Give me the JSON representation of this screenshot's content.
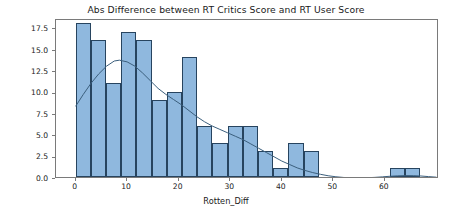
{
  "chart_data": {
    "type": "bar",
    "title": "Abs Difference between RT Critics Score and RT User Score",
    "xlabel": "Rotten_Diff",
    "ylabel": "",
    "grid": false,
    "legend": null,
    "xlim": [
      -3.8,
      70.5
    ],
    "ylim": [
      0,
      18.6
    ],
    "xticks": [
      0,
      10,
      20,
      30,
      40,
      50,
      60
    ],
    "xtick_labels": [
      "0",
      "10",
      "20",
      "30",
      "40",
      "50",
      "60"
    ],
    "yticks": [
      0.0,
      2.5,
      5.0,
      7.5,
      10.0,
      12.5,
      15.0,
      17.5
    ],
    "ytick_labels": [
      "0.0",
      "2.5",
      "5.0",
      "7.5",
      "10.0",
      "12.5",
      "15.0",
      "17.5"
    ],
    "bin_width": 2.95,
    "bins": [
      {
        "x0": 0.0,
        "x1": 2.95,
        "value": 18
      },
      {
        "x0": 2.95,
        "x1": 5.9,
        "value": 16
      },
      {
        "x0": 5.9,
        "x1": 8.85,
        "value": 11
      },
      {
        "x0": 8.85,
        "x1": 11.8,
        "value": 17
      },
      {
        "x0": 11.8,
        "x1": 14.75,
        "value": 16
      },
      {
        "x0": 14.75,
        "x1": 17.7,
        "value": 9
      },
      {
        "x0": 17.7,
        "x1": 20.65,
        "value": 10
      },
      {
        "x0": 20.65,
        "x1": 23.6,
        "value": 14
      },
      {
        "x0": 23.6,
        "x1": 26.55,
        "value": 6
      },
      {
        "x0": 26.55,
        "x1": 29.5,
        "value": 4
      },
      {
        "x0": 29.5,
        "x1": 32.45,
        "value": 6
      },
      {
        "x0": 32.45,
        "x1": 35.4,
        "value": 6
      },
      {
        "x0": 35.4,
        "x1": 38.35,
        "value": 3
      },
      {
        "x0": 38.35,
        "x1": 41.3,
        "value": 1
      },
      {
        "x0": 41.3,
        "x1": 44.25,
        "value": 4
      },
      {
        "x0": 44.25,
        "x1": 47.2,
        "value": 3
      },
      {
        "x0": 61.0,
        "x1": 63.95,
        "value": 1
      },
      {
        "x0": 63.95,
        "x1": 66.9,
        "value": 1
      }
    ],
    "kde": {
      "label": "kde-density-curve",
      "color": "#3b5f7d",
      "points": [
        [
          0.0,
          8.5
        ],
        [
          1.5,
          9.9
        ],
        [
          3.0,
          11.2
        ],
        [
          4.5,
          12.3
        ],
        [
          6.0,
          13.2
        ],
        [
          7.5,
          13.8
        ],
        [
          8.5,
          13.9
        ],
        [
          10.0,
          13.7
        ],
        [
          11.5,
          13.2
        ],
        [
          13.0,
          12.4
        ],
        [
          14.5,
          11.5
        ],
        [
          16.0,
          10.6
        ],
        [
          17.5,
          9.9
        ],
        [
          19.0,
          9.3
        ],
        [
          20.5,
          8.7
        ],
        [
          22.0,
          8.0
        ],
        [
          23.5,
          7.3
        ],
        [
          25.0,
          6.7
        ],
        [
          26.5,
          6.2
        ],
        [
          28.0,
          5.8
        ],
        [
          29.5,
          5.4
        ],
        [
          31.0,
          5.0
        ],
        [
          32.5,
          4.6
        ],
        [
          34.0,
          4.1
        ],
        [
          35.5,
          3.6
        ],
        [
          37.0,
          3.1
        ],
        [
          38.5,
          2.6
        ],
        [
          40.0,
          2.1
        ],
        [
          41.5,
          1.7
        ],
        [
          43.0,
          1.3
        ],
        [
          44.5,
          1.0
        ],
        [
          46.0,
          0.75
        ],
        [
          47.5,
          0.55
        ],
        [
          49.0,
          0.38
        ],
        [
          50.5,
          0.26
        ],
        [
          52.0,
          0.18
        ],
        [
          53.5,
          0.14
        ],
        [
          55.0,
          0.13
        ],
        [
          56.5,
          0.15
        ],
        [
          58.0,
          0.19
        ],
        [
          59.5,
          0.25
        ],
        [
          61.0,
          0.32
        ],
        [
          62.5,
          0.37
        ],
        [
          64.0,
          0.4
        ],
        [
          65.5,
          0.39
        ],
        [
          67.0,
          0.35
        ],
        [
          68.5,
          0.28
        ],
        [
          70.0,
          0.21
        ]
      ]
    },
    "colors": {
      "bar_fill": "#8fb8de",
      "bar_edge": "#27445f",
      "kde_line": "#3b5f7d",
      "axis": "#7a7a7a",
      "text": "#1a1a1a",
      "background": "#ffffff"
    }
  }
}
